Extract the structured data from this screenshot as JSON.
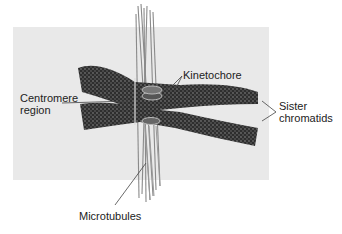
{
  "figure": {
    "background_color": "#e9e9e9",
    "chromatin_color": "#3a3a3a",
    "microtubule_color": "#8a8a8a"
  },
  "labels": {
    "kinetochore": "Kinetochore",
    "centromere_line1": "Centromere",
    "centromere_line2": "region",
    "sister_line1": "Sister",
    "sister_line2": "chromatids",
    "microtubules": "Microtubules"
  }
}
